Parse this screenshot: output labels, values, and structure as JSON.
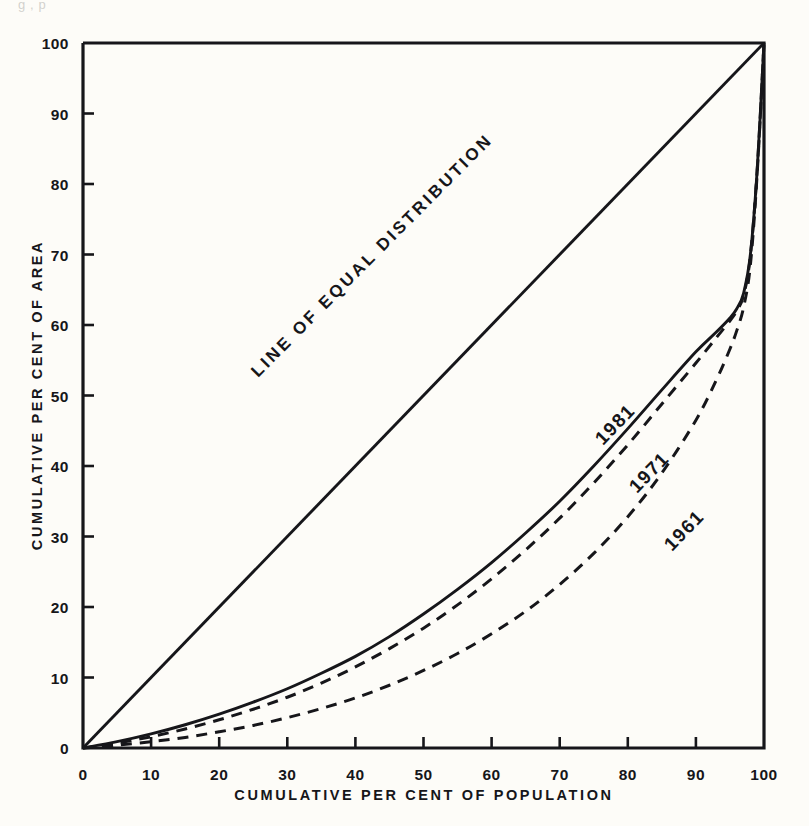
{
  "page": {
    "background_color": "#fdfcf8",
    "ink_color": "#16161a",
    "cropped_top_text": "g   ,                                                                p"
  },
  "chart_data": {
    "type": "line",
    "title": "",
    "subtitle": "",
    "xlabel": "CUMULATIVE PER CENT OF POPULATION",
    "ylabel": "CUMULATIVE PER CENT OF AREA",
    "xlim": [
      0,
      100
    ],
    "ylim": [
      0,
      100
    ],
    "xticks": [
      0,
      10,
      20,
      30,
      40,
      50,
      60,
      70,
      80,
      90,
      100
    ],
    "yticks": [
      0,
      10,
      20,
      30,
      40,
      50,
      60,
      70,
      80,
      90,
      100
    ],
    "xtick_labels": [
      "0",
      "10",
      "20",
      "30",
      "40",
      "50",
      "60",
      "70",
      "80",
      "90",
      "100"
    ],
    "ytick_labels": [
      "0",
      "10",
      "20",
      "30",
      "40",
      "50",
      "60",
      "70",
      "80",
      "90",
      "100"
    ],
    "grid": false,
    "legend": "inline-annotations",
    "annotations": [
      {
        "text": "LINE OF EQUAL DISTRIBUTION",
        "x": 44,
        "y": 46,
        "rotation": -45
      },
      {
        "text": "1981",
        "x": 78,
        "y": 40,
        "rotation": -45
      },
      {
        "text": "1971",
        "x": 84,
        "y": 35,
        "rotation": -45
      },
      {
        "text": "1961",
        "x": 90,
        "y": 27,
        "rotation": -45
      }
    ],
    "series": [
      {
        "name": "LINE OF EQUAL DISTRIBUTION",
        "style": "solid",
        "x": [
          0,
          100
        ],
        "values": [
          0,
          100
        ]
      },
      {
        "name": "1981",
        "style": "solid",
        "x": [
          0,
          5,
          10,
          15,
          20,
          25,
          30,
          35,
          40,
          45,
          50,
          55,
          60,
          65,
          70,
          75,
          80,
          85,
          90,
          93,
          95,
          96,
          97,
          98,
          99,
          100
        ],
        "values": [
          0,
          0.9,
          2.0,
          3.3,
          4.8,
          6.5,
          8.4,
          10.6,
          13.0,
          15.8,
          19.0,
          22.5,
          26.3,
          30.5,
          35.0,
          40.0,
          45.3,
          50.8,
          56.2,
          59.0,
          61.0,
          62.3,
          64.5,
          70.0,
          82.0,
          100
        ]
      },
      {
        "name": "1971",
        "style": "dashed",
        "x": [
          0,
          5,
          10,
          15,
          20,
          25,
          30,
          35,
          40,
          45,
          50,
          55,
          60,
          65,
          70,
          75,
          80,
          85,
          90,
          93,
          95,
          96,
          97,
          98,
          99,
          100
        ],
        "values": [
          0,
          0.7,
          1.6,
          2.7,
          4.0,
          5.5,
          7.2,
          9.2,
          11.5,
          14.1,
          17.0,
          20.3,
          24.0,
          28.1,
          32.6,
          37.6,
          43.0,
          48.8,
          54.6,
          58.2,
          60.6,
          62.0,
          64.2,
          69.8,
          82.0,
          100
        ]
      },
      {
        "name": "1961",
        "style": "dashed",
        "x": [
          0,
          5,
          10,
          15,
          20,
          25,
          30,
          35,
          40,
          45,
          50,
          55,
          60,
          65,
          70,
          75,
          80,
          85,
          90,
          93,
          95,
          96,
          97,
          98,
          99,
          100
        ],
        "values": [
          0,
          0.4,
          0.9,
          1.5,
          2.3,
          3.2,
          4.3,
          5.6,
          7.1,
          8.9,
          11.0,
          13.4,
          16.2,
          19.4,
          23.2,
          27.6,
          32.8,
          39.0,
          46.5,
          52.2,
          56.6,
          59.2,
          62.5,
          68.5,
          81.5,
          100
        ]
      }
    ]
  },
  "axes": {
    "x_title": "CUMULATIVE PER CENT OF POPULATION",
    "y_title": "CUMULATIVE PER CENT OF AREA"
  }
}
